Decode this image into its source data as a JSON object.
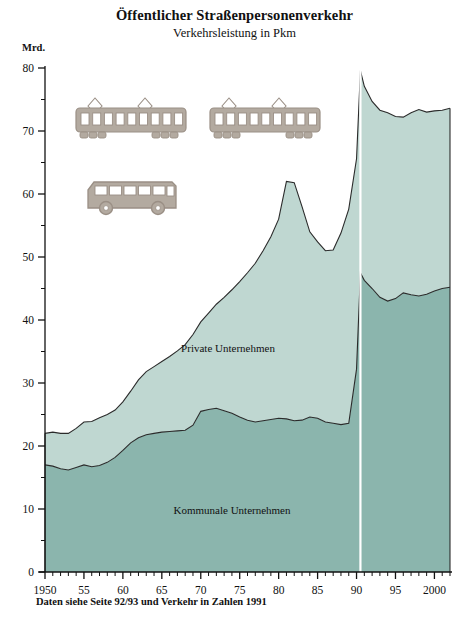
{
  "header": {
    "title": "Öffentlicher Straßenpersonenverkehr",
    "subtitle": "Verkehrsleistung in Pkm"
  },
  "unit_label": "Mrd.",
  "footnote": "Daten siehe Seite 92/93 und Verkehr in Zahlen 1991",
  "colors": {
    "lower_series": "#8bb5ad",
    "upper_series": "#bfd7d1",
    "line": "#2b2b2b",
    "axis": "#111111",
    "break_line": "#ffffff",
    "vehicle_body": "#9a8f85",
    "vehicle_fill": "#b3aaa0"
  },
  "illustrations": [
    {
      "name": "tram-car-left",
      "type": "tram"
    },
    {
      "name": "tram-car-right",
      "type": "tram"
    },
    {
      "name": "bus",
      "type": "bus"
    }
  ],
  "chart_data": {
    "type": "area",
    "stacked": true,
    "title": "Öffentlicher Straßenpersonenverkehr",
    "subtitle": "Verkehrsleistung in Pkm",
    "xlabel": "",
    "ylabel": "Mrd.",
    "ylim": [
      0,
      80
    ],
    "xlim": [
      1950,
      2002
    ],
    "grid": false,
    "legend": "inline-labels",
    "y_major_ticks": [
      0,
      10,
      20,
      30,
      40,
      50,
      60,
      70,
      80
    ],
    "y_minor_step": 5,
    "x_tick_labels": [
      "1950",
      "55",
      "60",
      "65",
      "70",
      "75",
      "80",
      "85",
      "90",
      "95",
      "2000"
    ],
    "x_tick_years": [
      1950,
      1955,
      1960,
      1965,
      1970,
      1975,
      1980,
      1985,
      1990,
      1995,
      2000
    ],
    "x_minor_step": 1,
    "break_year": 1990.5,
    "break_note": "Vertikale weiße Linie bei 1990 (Gebietsstandwechsel)",
    "x": [
      1950,
      1951,
      1952,
      1953,
      1954,
      1955,
      1956,
      1957,
      1958,
      1959,
      1960,
      1961,
      1962,
      1963,
      1964,
      1965,
      1966,
      1967,
      1968,
      1969,
      1970,
      1971,
      1972,
      1973,
      1974,
      1975,
      1976,
      1977,
      1978,
      1979,
      1980,
      1981,
      1982,
      1983,
      1984,
      1985,
      1986,
      1987,
      1988,
      1989,
      1990,
      1990.5,
      1991,
      1992,
      1993,
      1994,
      1995,
      1996,
      1997,
      1998,
      1999,
      2000,
      2001,
      2002
    ],
    "series": [
      {
        "name": "Kommunale Unternehmen",
        "label": "Kommunale Unternehmen",
        "color": "#8bb5ad",
        "values": [
          17.0,
          16.8,
          16.4,
          16.2,
          16.6,
          17.0,
          16.7,
          16.9,
          17.4,
          18.2,
          19.3,
          20.5,
          21.3,
          21.8,
          22.0,
          22.2,
          22.3,
          22.4,
          22.5,
          23.3,
          25.5,
          25.8,
          26.0,
          25.6,
          25.2,
          24.6,
          24.1,
          23.8,
          24.0,
          24.2,
          24.4,
          24.3,
          24.0,
          24.1,
          24.6,
          24.4,
          23.8,
          23.6,
          23.4,
          23.6,
          32.2,
          47.5,
          46.3,
          45.0,
          43.6,
          43.0,
          43.4,
          44.3,
          44.0,
          43.8,
          44.1,
          44.6,
          45.0,
          45.2
        ]
      },
      {
        "name": "Private Unternehmen",
        "label": "Private Unternehmen",
        "color": "#bfd7d1",
        "values": [
          5.0,
          5.4,
          5.6,
          5.8,
          6.2,
          6.8,
          7.2,
          7.6,
          7.6,
          7.5,
          7.7,
          8.2,
          9.2,
          10.0,
          10.6,
          11.2,
          11.9,
          12.7,
          13.6,
          14.4,
          14.2,
          15.3,
          16.5,
          18.0,
          19.6,
          21.5,
          23.4,
          25.2,
          27.0,
          29.0,
          31.6,
          37.7,
          37.8,
          33.9,
          29.4,
          28.0,
          27.2,
          27.5,
          30.4,
          34.0,
          33.4,
          32.1,
          30.8,
          29.7,
          29.7,
          29.9,
          28.9,
          27.9,
          28.9,
          29.6,
          28.9,
          28.6,
          28.3,
          28.4
        ]
      }
    ],
    "totals_note": "Gestapelt: Gesamtwert = Kommunale + Private",
    "totals": [
      22.0,
      22.2,
      22.0,
      22.0,
      22.8,
      23.8,
      23.9,
      24.5,
      25.0,
      25.7,
      27.0,
      28.7,
      30.5,
      31.8,
      32.6,
      33.4,
      34.2,
      35.1,
      36.1,
      37.7,
      39.7,
      41.1,
      42.5,
      43.6,
      44.8,
      46.1,
      47.5,
      49.0,
      51.0,
      53.2,
      56.0,
      62.0,
      61.8,
      58.0,
      54.0,
      52.4,
      51.0,
      51.1,
      53.8,
      57.6,
      65.6,
      79.6,
      77.1,
      74.7,
      73.3,
      72.9,
      72.3,
      72.2,
      72.9,
      73.4,
      73.0,
      73.2,
      73.3,
      73.6
    ]
  }
}
